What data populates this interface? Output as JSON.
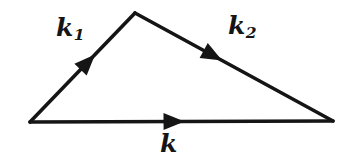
{
  "diagram": {
    "background_color": "#ffffff",
    "line_color": "#151515",
    "line_width": 3.6,
    "arrow_length": 21,
    "arrow_half_width": 8.5,
    "vectors": [
      {
        "name": "k1",
        "label_base": "k",
        "label_sub": "1",
        "from": [
          30,
          122
        ],
        "to": [
          135,
          13
        ],
        "arrow_at": 0.62
      },
      {
        "name": "k2",
        "label_base": "k",
        "label_sub": "2",
        "from": [
          135,
          13
        ],
        "to": [
          333,
          121
        ],
        "arrow_at": 0.44
      },
      {
        "name": "k",
        "label_base": "k",
        "label_sub": "",
        "from": [
          30,
          122
        ],
        "to": [
          333,
          121
        ],
        "arrow_at": 0.51
      }
    ]
  }
}
